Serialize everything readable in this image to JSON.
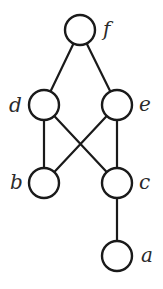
{
  "diagram": {
    "type": "hasse-diagram",
    "stroke_color": "#1a1a1a",
    "label_color": "#2a2a2a",
    "node_radius": 15,
    "nodes": [
      {
        "id": "f",
        "label": "f",
        "cx": 80,
        "cy": 30,
        "label_x": 103,
        "label_y": 36
      },
      {
        "id": "d",
        "label": "d",
        "cx": 44,
        "cy": 105,
        "label_x": 9,
        "label_y": 112
      },
      {
        "id": "e",
        "label": "e",
        "cx": 117,
        "cy": 105,
        "label_x": 139,
        "label_y": 111
      },
      {
        "id": "b",
        "label": "b",
        "cx": 44,
        "cy": 183,
        "label_x": 10,
        "label_y": 189
      },
      {
        "id": "c",
        "label": "c",
        "cx": 117,
        "cy": 183,
        "label_x": 139,
        "label_y": 189
      },
      {
        "id": "a",
        "label": "a",
        "cx": 117,
        "cy": 256,
        "label_x": 141,
        "label_y": 262
      }
    ],
    "edges": [
      {
        "from": "f",
        "to": "d"
      },
      {
        "from": "f",
        "to": "e"
      },
      {
        "from": "d",
        "to": "b"
      },
      {
        "from": "d",
        "to": "c"
      },
      {
        "from": "e",
        "to": "b"
      },
      {
        "from": "e",
        "to": "c"
      },
      {
        "from": "c",
        "to": "a"
      }
    ]
  }
}
